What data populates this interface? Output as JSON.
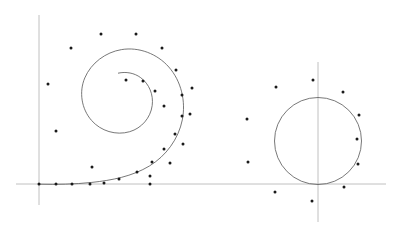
{
  "figure": {
    "title": "Spiral and circle with marker points",
    "background_color": "#ffffff",
    "width": 399,
    "height": 225,
    "axis_color": "#b0b0b0",
    "curve_color": "#555555",
    "point_color": "#1a1a1a",
    "axis_stroke_width": 0.8,
    "curve_stroke_width": 0.8,
    "point_radius": 1.5
  },
  "chart_data": {
    "type": "scatter",
    "title": "Spiral and circle with marker points",
    "xlabel": "",
    "ylabel": "",
    "grid": false,
    "legend": "none",
    "xlim": [
      0,
      399
    ],
    "ylim": [
      225,
      0
    ],
    "axes": [
      {
        "name": "left-vertical-axis",
        "orientation": "vertical",
        "x": 39,
        "y_start": 15,
        "y_end": 205
      },
      {
        "name": "horizontal-axis",
        "orientation": "horizontal",
        "y": 184,
        "x_start": 16,
        "x_end": 386
      },
      {
        "name": "right-vertical-axis",
        "orientation": "vertical",
        "x": 318,
        "y_start": 62,
        "y_end": 222
      }
    ],
    "curves": [
      {
        "name": "spiral-curve",
        "type": "spiral",
        "center": [
          150,
          116
        ],
        "start_point": [
          118,
          73
        ],
        "end_point": [
          39,
          184
        ],
        "description": "logarithmic spiral winding outward counterclockwise from inner centre to x-axis origin",
        "path": "M 118.0 73.2 C 126.2 71.4 134.4 73.0 140.6 77.6 C 149.3 84.0 153.6 94.8 152.2 105.5 C 150.6 117.8 141.6 128.2 129.7 131.7 C 116.1 135.7 100.8 131.1 91.5 120.4 C 81.5 108.9 78.8 92.0 84.8 77.9 C 91.1 63.0 105.6 52.2 121.5 49.6 C 138.9 46.7 157.2 53.8 168.8 67.0 C 181.3 81.2 186.0 101.4 182.3 119.9 C 178.5 139.0 166.0 155.9 149.4 166.0 C 132.3 176.4 111.6 180.3 91.9 182.4 C 74.3 184.3 56.6 184.6 39.0 184.2"
      },
      {
        "name": "circle-curve",
        "type": "circle",
        "center": [
          318,
          141
        ],
        "radius": 43.5,
        "description": "circle tangent to the horizontal axis, bisected by the right vertical axis"
      }
    ],
    "point_groups": [
      {
        "name": "spiral-points",
        "count": 30,
        "points": [
          [
            101,
            34
          ],
          [
            136,
            34
          ],
          [
            71,
            48
          ],
          [
            162,
            48
          ],
          [
            48,
            84
          ],
          [
            176,
            70
          ],
          [
            164,
            106
          ],
          [
            182,
            95
          ],
          [
            182,
            116
          ],
          [
            175,
            134
          ],
          [
            164,
            149
          ],
          [
            152,
            162
          ],
          [
            137,
            172
          ],
          [
            119,
            179
          ],
          [
            104,
            183
          ],
          [
            90,
            184
          ],
          [
            72,
            184
          ],
          [
            56,
            184
          ],
          [
            39,
            184
          ],
          [
            150,
            184
          ],
          [
            56,
            131
          ],
          [
            92,
            167
          ],
          [
            126,
            80
          ],
          [
            143,
            81
          ],
          [
            155,
            91
          ],
          [
            192,
            88
          ],
          [
            190,
            114
          ],
          [
            183,
            144
          ],
          [
            170,
            163
          ],
          [
            150,
            176
          ]
        ]
      },
      {
        "name": "circle-points",
        "count": 11,
        "points": [
          [
            313,
            80
          ],
          [
            276,
            87
          ],
          [
            343,
            92
          ],
          [
            247,
            119
          ],
          [
            359,
            115
          ],
          [
            357,
            139
          ],
          [
            248,
            162
          ],
          [
            358,
            164
          ],
          [
            275,
            192
          ],
          [
            344,
            187
          ],
          [
            312,
            201
          ]
        ]
      }
    ]
  }
}
